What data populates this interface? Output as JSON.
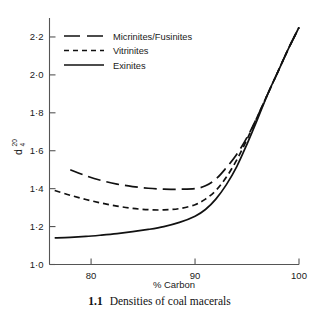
{
  "figure": {
    "caption_number": "1.1",
    "caption_text": "Densities of coal macerals"
  },
  "chart_data": {
    "type": "line",
    "title": "",
    "xlabel": "% Carbon",
    "ylabel": "d",
    "ylabel_superscript": "20",
    "ylabel_subscript": "4",
    "xlim": [
      76,
      100
    ],
    "ylim": [
      1.0,
      2.3
    ],
    "xticks": [
      80,
      90,
      100
    ],
    "xtick_labels": [
      "80",
      "90",
      "100"
    ],
    "yticks": [
      1.0,
      1.2,
      1.4,
      1.6,
      1.8,
      2.0,
      2.2
    ],
    "ytick_labels": [
      "1·0",
      "1·2",
      "1·4",
      "1·6",
      "1·8",
      "2·0",
      "2·2"
    ],
    "grid": false,
    "legend_position": "upper-left",
    "line_color": "#111111",
    "axis_color": "#555555",
    "series": [
      {
        "name": "Micrinites/Fusinites",
        "style": "long-dash",
        "x": [
          78.0,
          79.5,
          81.0,
          82.5,
          84.0,
          85.5,
          87.0,
          88.5,
          90.0,
          91.0,
          92.0,
          93.0,
          94.0,
          95.0,
          96.0,
          97.0,
          98.0,
          99.0,
          100.0
        ],
        "y": [
          1.5,
          1.468,
          1.443,
          1.424,
          1.411,
          1.402,
          1.397,
          1.397,
          1.4,
          1.415,
          1.45,
          1.51,
          1.58,
          1.67,
          1.78,
          1.9,
          2.02,
          2.14,
          2.25
        ]
      },
      {
        "name": "Vitrinites",
        "style": "short-dash",
        "x": [
          76.5,
          78.0,
          79.5,
          81.0,
          82.5,
          84.0,
          85.5,
          87.0,
          88.5,
          90.0,
          91.0,
          92.0,
          93.0,
          94.0,
          95.0,
          96.0,
          97.0,
          98.0,
          99.0,
          100.0
        ],
        "y": [
          1.39,
          1.365,
          1.343,
          1.324,
          1.308,
          1.296,
          1.289,
          1.288,
          1.295,
          1.315,
          1.345,
          1.39,
          1.46,
          1.55,
          1.66,
          1.78,
          1.9,
          2.02,
          2.14,
          2.25
        ]
      },
      {
        "name": "Exinites",
        "style": "solid",
        "x": [
          76.5,
          78.0,
          79.5,
          81.0,
          82.5,
          84.0,
          85.5,
          87.0,
          88.5,
          90.0,
          91.0,
          92.0,
          93.0,
          94.0,
          95.0,
          96.0,
          97.0,
          98.0,
          99.0,
          100.0
        ],
        "y": [
          1.14,
          1.143,
          1.148,
          1.155,
          1.163,
          1.173,
          1.185,
          1.2,
          1.222,
          1.255,
          1.29,
          1.345,
          1.42,
          1.515,
          1.635,
          1.765,
          1.9,
          2.02,
          2.14,
          2.25
        ]
      }
    ],
    "legend": [
      {
        "label": "Micrinites/Fusinites",
        "style": "long-dash"
      },
      {
        "label": "Vitrinites",
        "style": "short-dash"
      },
      {
        "label": "Exinites",
        "style": "solid"
      }
    ]
  }
}
